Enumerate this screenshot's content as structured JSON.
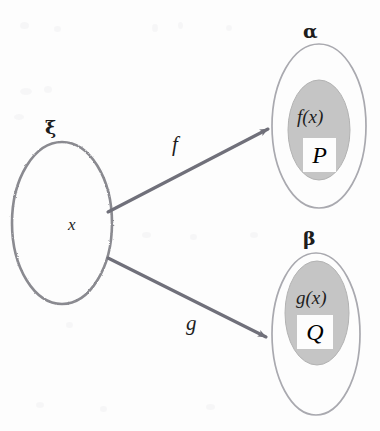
{
  "figure": {
    "type": "set-mapping-diagram",
    "background_color": "#fdfdfd",
    "ink_color": "#6e6e72",
    "text_color": "#1d1d1d",
    "shade_color": "#c3c3c3"
  },
  "domain_set": {
    "label": "ξ",
    "element": "x"
  },
  "codomain_sets": [
    {
      "label": "α",
      "image_expr": "f(x)",
      "highlighted": "P"
    },
    {
      "label": "β",
      "image_expr": "g(x)",
      "highlighted": "Q"
    }
  ],
  "maps": [
    {
      "label": "f",
      "from": "ξ",
      "to": "α"
    },
    {
      "label": "g",
      "from": "ξ",
      "to": "β"
    }
  ]
}
